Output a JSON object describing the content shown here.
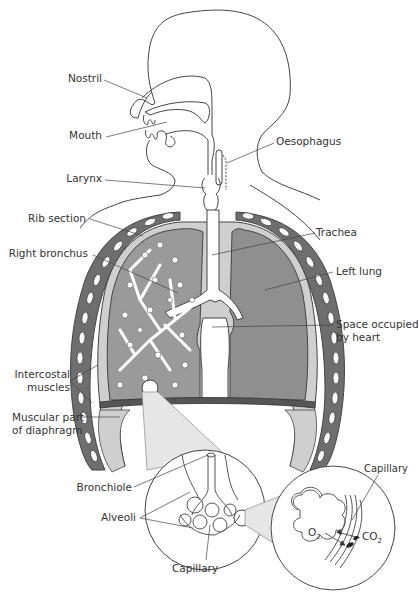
{
  "diagram": {
    "colors": {
      "outline": "#444444",
      "lung_fill": "#8f8f8f",
      "lung_right_fill": "#9a9a9a",
      "rib_fill": "#6e6e6e",
      "pleura_fill": "#cfcfcf",
      "diaphragm_dark": "#555555",
      "magnify_cone": "#e6e6e6",
      "text": "#333333"
    },
    "labels": {
      "nostril": "Nostril",
      "mouth": "Mouth",
      "larynx": "Larynx",
      "oesophagus": "Oesophagus",
      "rib_section": "Rib section",
      "right_bronchus": "Right bronchus",
      "trachea": "Trachea",
      "left_lung": "Left lung",
      "space_heart_1": "Space occupied",
      "space_heart_2": "by heart",
      "intercostal_1": "Intercostal",
      "intercostal_2": "muscles",
      "diaphragm_1": "Muscular part",
      "diaphragm_2": "of diaphragm",
      "bronchiole": "Bronchiole",
      "alveoli": "Alveoli",
      "capillary_inset": "Capillary",
      "capillary_detail": "Capillary"
    },
    "chemistry": {
      "o2_base": "O",
      "o2_sub": "2",
      "co2_base": "CO",
      "co2_sub": "2"
    }
  }
}
